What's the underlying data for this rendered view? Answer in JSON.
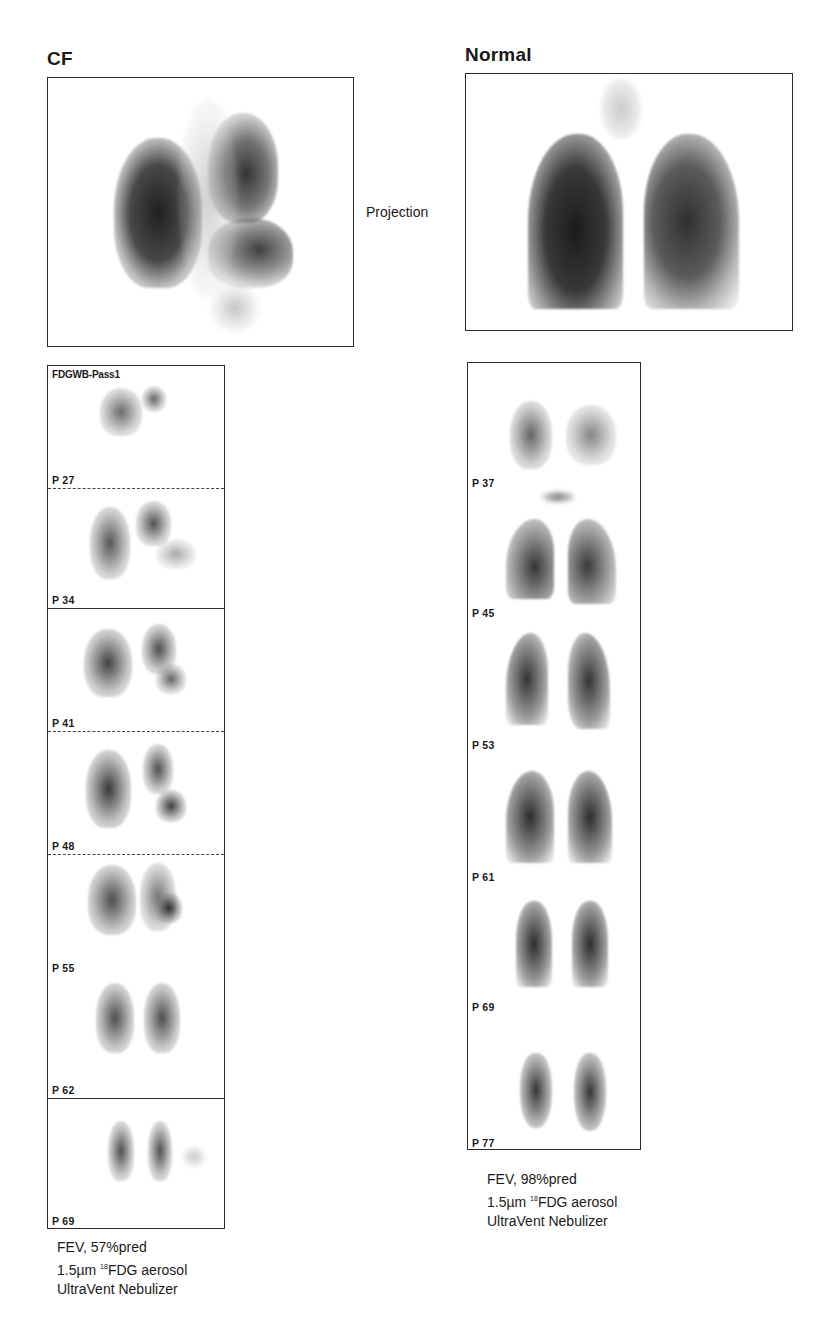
{
  "figure": {
    "left_panel": {
      "title": "CF",
      "strip_header": "FDGWB-Pass1",
      "slices": [
        {
          "label": "P 27"
        },
        {
          "label": "P 34"
        },
        {
          "label": "P 41"
        },
        {
          "label": "P 48"
        },
        {
          "label": "P 55"
        },
        {
          "label": "P 62"
        },
        {
          "label": "P 69"
        }
      ],
      "caption": {
        "line1": "FEV, 57%pred",
        "line2_prefix": "1.5µm ",
        "line2_sup": "18",
        "line2_suffix": "FDG aerosol",
        "line3": "UltraVent Nebulizer"
      }
    },
    "center_label": "Projection",
    "right_panel": {
      "title": "Normal",
      "slices": [
        {
          "label": "P 37"
        },
        {
          "label": "P 45"
        },
        {
          "label": "P 53"
        },
        {
          "label": "P 61"
        },
        {
          "label": "P 69"
        },
        {
          "label": "P 77"
        }
      ],
      "caption": {
        "line1": "FEV, 98%pred",
        "line2_prefix": "1.5µm ",
        "line2_sup": "18",
        "line2_suffix": "FDG aerosol",
        "line3": "UltraVent Nebulizer"
      }
    }
  }
}
